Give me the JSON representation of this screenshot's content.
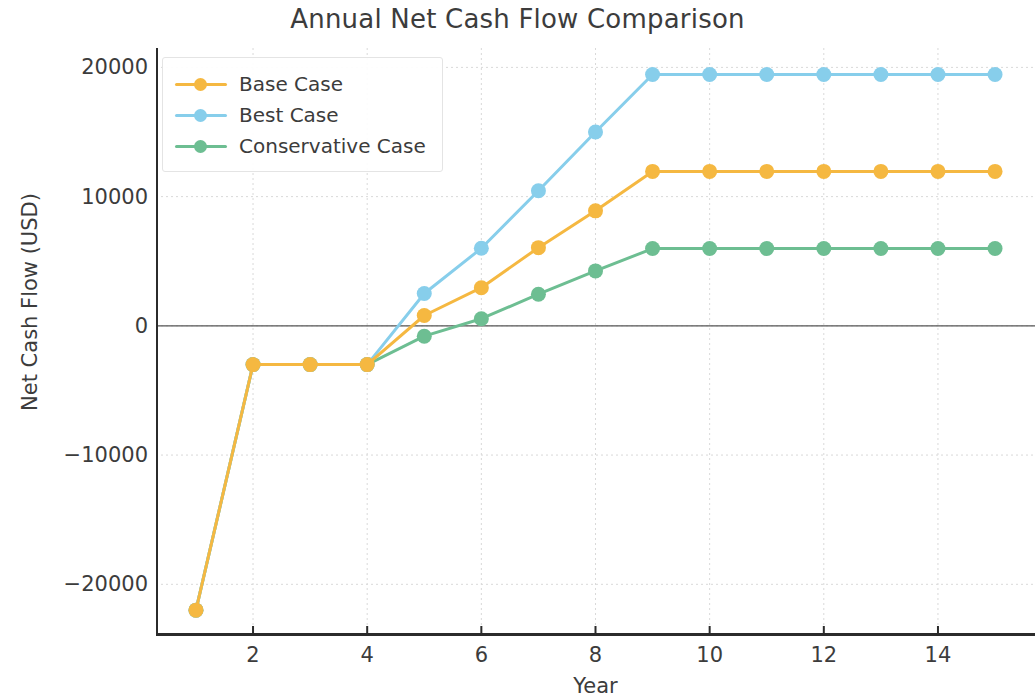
{
  "chart_data": {
    "type": "line",
    "title": "Annual Net Cash Flow Comparison",
    "xlabel": "Year",
    "ylabel": "Net Cash Flow (USD)",
    "x": [
      1,
      2,
      3,
      4,
      5,
      6,
      7,
      8,
      9,
      10,
      11,
      12,
      13,
      14,
      15
    ],
    "xlim": [
      0.3,
      15.7
    ],
    "ylim": [
      -24000,
      21500
    ],
    "xticks": [
      2,
      4,
      6,
      8,
      10,
      12,
      14
    ],
    "xtick_labels": [
      "2",
      "4",
      "6",
      "8",
      "10",
      "12",
      "14"
    ],
    "yticks": [
      -20000,
      -10000,
      0,
      10000,
      20000
    ],
    "ytick_labels": [
      "−20000",
      "−10000",
      "0",
      "10000",
      "20000"
    ],
    "grid": true,
    "legend_position": "upper left",
    "zero_line": true,
    "series": [
      {
        "name": "Base Case",
        "color": "#F5B841",
        "values": [
          -22000,
          -3000,
          -3000,
          -3000,
          800,
          2950,
          6050,
          8900,
          11950,
          11950,
          11950,
          11950,
          11950,
          11950,
          11950
        ]
      },
      {
        "name": "Best Case",
        "color": "#87CEEB",
        "values": [
          -22000,
          -3000,
          -3000,
          -3000,
          2500,
          6000,
          10450,
          15000,
          19450,
          19450,
          19450,
          19450,
          19450,
          19450,
          19450
        ]
      },
      {
        "name": "Conservative Case",
        "color": "#6DBE92",
        "values": [
          -22000,
          -3000,
          -3000,
          -3000,
          -800,
          550,
          2450,
          4250,
          5980,
          5980,
          5980,
          5980,
          5980,
          5980,
          5980
        ]
      }
    ]
  }
}
